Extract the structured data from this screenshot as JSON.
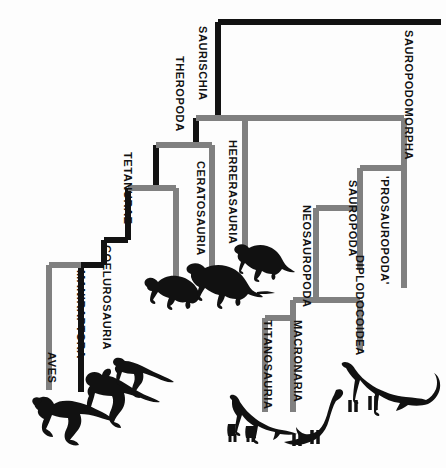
{
  "figure": {
    "type": "cladogram",
    "background_color": "#fdfdfd",
    "lineage_colors": {
      "black_lineage": "#121212",
      "gray_lineage": "#808080"
    }
  },
  "labels": {
    "saurischia": "SAURISCHIA",
    "theropoda": "THEROPODA",
    "tetanurae": "TETANURAE",
    "coelurosauria": "COELUROSAURIA",
    "maniraptora": "MANIRAPTORA",
    "aves": "AVES",
    "ceratosauria": "CERATOSAURIA",
    "herrerasauria": "HERRERASAURIA",
    "sauropodomorpha": "SAUROPODOMORPHA",
    "prosauropoda": "'PROSAUROPODA'",
    "sauropoda": "SAUROPODA",
    "neosauropoda": "NEOSAUROPODA",
    "diplodocoidea": "DIPLODOCOIDEA",
    "macronaria": "MACRONARIA",
    "titanosauria": "TITANOSAURIA"
  },
  "label_positions": [
    {
      "key": "saurischia",
      "name": "clade-label-saurischia",
      "x": 208,
      "y": 26,
      "color": "#121212"
    },
    {
      "key": "theropoda",
      "name": "clade-label-theropoda",
      "x": 185,
      "y": 56,
      "color": "#121212"
    },
    {
      "key": "tetanurae",
      "name": "clade-label-tetanurae",
      "x": 133,
      "y": 152,
      "color": "#121212"
    },
    {
      "key": "coelurosauria",
      "name": "clade-label-coelurosauria",
      "x": 112,
      "y": 245,
      "color": "#121212"
    },
    {
      "key": "maniraptora",
      "name": "clade-label-maniraptora",
      "x": 86,
      "y": 270,
      "color": "#121212"
    },
    {
      "key": "aves",
      "name": "clade-label-aves",
      "x": 57,
      "y": 352,
      "color": "#121212"
    },
    {
      "key": "ceratosauria",
      "name": "clade-label-ceratosauria",
      "x": 206,
      "y": 161,
      "color": "#121212"
    },
    {
      "key": "herrerasauria",
      "name": "clade-label-herrerasauria",
      "x": 238,
      "y": 140,
      "color": "#121212"
    },
    {
      "key": "sauropodomorpha",
      "name": "clade-label-sauropodomorpha",
      "x": 414,
      "y": 30,
      "color": "#121212"
    },
    {
      "key": "prosauropoda",
      "name": "clade-label-prosauropoda",
      "x": 390,
      "y": 176,
      "color": "#121212"
    },
    {
      "key": "sauropoda",
      "name": "clade-label-sauropoda",
      "x": 358,
      "y": 180,
      "color": "#121212"
    },
    {
      "key": "neosauropoda",
      "name": "clade-label-neosauropoda",
      "x": 312,
      "y": 205,
      "color": "#121212"
    },
    {
      "key": "diplodocoidea",
      "name": "clade-label-diplodocoidea",
      "x": 365,
      "y": 255,
      "color": "#121212"
    },
    {
      "key": "macronaria",
      "name": "clade-label-macronaria",
      "x": 303,
      "y": 320,
      "color": "#121212"
    },
    {
      "key": "titanosauria",
      "name": "clade-label-titanosauria",
      "x": 273,
      "y": 320,
      "color": "#121212"
    }
  ],
  "chart_data": {
    "type": "diagram",
    "nodes": [
      {
        "id": "saurischia",
        "label": "SAURISCHIA",
        "lineage": "black",
        "rank": "node"
      },
      {
        "id": "theropoda",
        "label": "THEROPODA",
        "lineage": "black",
        "rank": "node"
      },
      {
        "id": "herrerasauria",
        "label": "HERRERASAURIA",
        "lineage": "gray",
        "rank": "tip"
      },
      {
        "id": "ceratosauria",
        "label": "CERATOSAURIA",
        "lineage": "gray",
        "rank": "tip"
      },
      {
        "id": "tetanurae",
        "label": "TETANURAE",
        "lineage": "black",
        "rank": "node"
      },
      {
        "id": "coelurosauria",
        "label": "COELUROSAURIA",
        "lineage": "gray",
        "rank": "tip"
      },
      {
        "id": "maniraptora",
        "label": "MANIRAPTORA",
        "lineage": "black",
        "rank": "node"
      },
      {
        "id": "aves",
        "label": "AVES",
        "lineage": "gray",
        "rank": "tip"
      },
      {
        "id": "sauropodomorpha",
        "label": "SAUROPODOMORPHA",
        "lineage": "gray",
        "rank": "node"
      },
      {
        "id": "prosauropoda",
        "label": "'PROSAUROPODA'",
        "lineage": "gray",
        "rank": "tip"
      },
      {
        "id": "sauropoda",
        "label": "SAUROPODA",
        "lineage": "gray",
        "rank": "node"
      },
      {
        "id": "neosauropoda",
        "label": "NEOSAUROPODA",
        "lineage": "gray",
        "rank": "node"
      },
      {
        "id": "diplodocoidea",
        "label": "DIPLODOCOIDEA",
        "lineage": "gray",
        "rank": "tip"
      },
      {
        "id": "macronaria",
        "label": "MACRONARIA",
        "lineage": "gray",
        "rank": "node"
      },
      {
        "id": "titanosauria",
        "label": "TITANOSAURIA",
        "lineage": "gray",
        "rank": "tip"
      }
    ],
    "edges": [
      {
        "parent": "saurischia",
        "child": "theropoda"
      },
      {
        "parent": "saurischia",
        "child": "sauropodomorpha"
      },
      {
        "parent": "theropoda",
        "child": "herrerasauria"
      },
      {
        "parent": "theropoda",
        "child": "ceratosauria"
      },
      {
        "parent": "theropoda",
        "child": "tetanurae"
      },
      {
        "parent": "tetanurae",
        "child": "coelurosauria"
      },
      {
        "parent": "tetanurae",
        "child": "maniraptora"
      },
      {
        "parent": "maniraptora",
        "child": "aves"
      },
      {
        "parent": "sauropodomorpha",
        "child": "prosauropoda"
      },
      {
        "parent": "sauropodomorpha",
        "child": "sauropoda"
      },
      {
        "parent": "sauropoda",
        "child": "neosauropoda"
      },
      {
        "parent": "neosauropoda",
        "child": "diplodocoidea"
      },
      {
        "parent": "neosauropoda",
        "child": "macronaria"
      },
      {
        "parent": "macronaria",
        "child": "titanosauria"
      }
    ]
  },
  "silhouettes": [
    {
      "name": "silhouette-bird-like-theropod-left",
      "x": 30,
      "y": 385,
      "w": 82,
      "h": 62
    },
    {
      "name": "silhouette-oviraptorosaur",
      "x": 78,
      "y": 368,
      "w": 82,
      "h": 58
    },
    {
      "name": "silhouette-small-coelurosaur",
      "x": 110,
      "y": 355,
      "w": 62,
      "h": 36
    },
    {
      "name": "silhouette-ceratosaur",
      "x": 143,
      "y": 263,
      "w": 58,
      "h": 44
    },
    {
      "name": "silhouette-large-theropod",
      "x": 185,
      "y": 258,
      "w": 75,
      "h": 42
    },
    {
      "name": "silhouette-herrerasaur",
      "x": 232,
      "y": 238,
      "w": 62,
      "h": 38
    },
    {
      "name": "silhouette-titanosaur",
      "x": 222,
      "y": 392,
      "w": 78,
      "h": 48
    },
    {
      "name": "silhouette-brachiosaur",
      "x": 282,
      "y": 385,
      "w": 72,
      "h": 62
    },
    {
      "name": "silhouette-diplodocid",
      "x": 340,
      "y": 360,
      "w": 100,
      "h": 60
    }
  ]
}
